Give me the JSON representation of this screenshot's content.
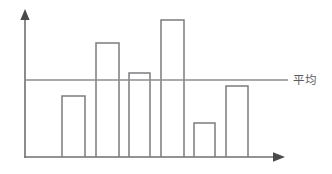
{
  "chart_data": {
    "type": "bar",
    "title": "",
    "xlabel": "",
    "ylabel": "",
    "grid": false,
    "legend_position": "right-of-average-line",
    "categories": [
      "1",
      "2",
      "3",
      "4",
      "5",
      "6"
    ],
    "values": [
      42,
      85,
      63,
      102,
      26,
      56
    ],
    "ylim": [
      0,
      120
    ],
    "annotations": [
      {
        "name": "average-line",
        "label": "平均",
        "type": "horizontal-reference-line",
        "value": 62.3
      }
    ],
    "axes": {
      "x_axis_arrow": true,
      "y_axis_arrow": true,
      "tick_labels_visible": false
    }
  },
  "figure": {
    "mean_label": "平均",
    "colors": {
      "axis": "#6f6f72",
      "bar_stroke": "#7c7c80",
      "mean_line": "#8e8e92",
      "label_text": "#5c5c60",
      "background": "#ffffff"
    }
  },
  "geometry": {
    "origin_x": 25,
    "baseline_y": 157,
    "y_axis_top": 12,
    "x_axis_right": 283,
    "mean_y": 80,
    "mean_line_x_end": 288,
    "bars": [
      {
        "x": 62,
        "width": 23,
        "top": 96
      },
      {
        "x": 96,
        "width": 23,
        "top": 43
      },
      {
        "x": 129,
        "width": 21,
        "top": 73
      },
      {
        "x": 161,
        "width": 23,
        "top": 20
      },
      {
        "x": 194,
        "width": 21,
        "top": 123
      },
      {
        "x": 226,
        "width": 22,
        "top": 86
      }
    ],
    "label_x": 293,
    "label_y": 80
  }
}
